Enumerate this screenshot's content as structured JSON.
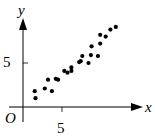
{
  "chart_data": {
    "type": "scatter",
    "title": "",
    "xlabel": "x",
    "ylabel": "y",
    "origin_label": "O",
    "x_ticks": [
      {
        "value": 5,
        "label": "5"
      }
    ],
    "y_ticks": [
      {
        "value": 5,
        "label": "5"
      }
    ],
    "xlim": [
      -1.5,
      15.5
    ],
    "ylim": [
      -2.5,
      10.5
    ],
    "grid": false,
    "legend": null,
    "points": [
      {
        "x": 1.5,
        "y": 1.8
      },
      {
        "x": 1.6,
        "y": 1.0
      },
      {
        "x": 2.8,
        "y": 2.1
      },
      {
        "x": 3.2,
        "y": 3.1
      },
      {
        "x": 3.7,
        "y": 1.8
      },
      {
        "x": 4.2,
        "y": 3.2
      },
      {
        "x": 4.5,
        "y": 3.1
      },
      {
        "x": 5.3,
        "y": 4.1
      },
      {
        "x": 5.7,
        "y": 3.9
      },
      {
        "x": 6.2,
        "y": 4.5
      },
      {
        "x": 6.2,
        "y": 4.1
      },
      {
        "x": 7.2,
        "y": 5.1
      },
      {
        "x": 7.4,
        "y": 5.2
      },
      {
        "x": 7.6,
        "y": 5.8
      },
      {
        "x": 8.4,
        "y": 5.0
      },
      {
        "x": 8.7,
        "y": 5.9
      },
      {
        "x": 8.8,
        "y": 6.9
      },
      {
        "x": 9.6,
        "y": 5.8
      },
      {
        "x": 9.9,
        "y": 7.2
      },
      {
        "x": 9.9,
        "y": 8.2
      },
      {
        "x": 10.6,
        "y": 8.0
      },
      {
        "x": 11.2,
        "y": 8.8
      },
      {
        "x": 11.9,
        "y": 9.1
      }
    ]
  },
  "labels": {
    "x_axis": "x",
    "y_axis": "y",
    "origin": "O",
    "x_tick_5": "5",
    "y_tick_5": "5"
  }
}
